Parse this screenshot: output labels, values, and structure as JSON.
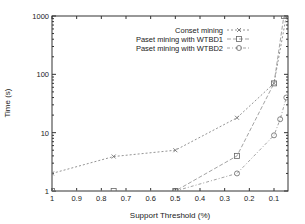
{
  "chart_data": {
    "type": "line",
    "title": "",
    "xlabel": "Support Threshold (%)",
    "ylabel": "Time (s)",
    "xscale": "linear-reversed",
    "yscale": "log",
    "xlim": [
      1,
      0.05
    ],
    "ylim": [
      1,
      1000
    ],
    "xticks": [
      "1",
      "0.9",
      "0.8",
      "0.7",
      "0.6",
      "0.5",
      "0.4",
      "0.3",
      "0.2",
      "0.1"
    ],
    "yticks": [
      "1",
      "10",
      "100",
      "1000"
    ],
    "legend_position": "upper right",
    "series": [
      {
        "name": "Conset mining",
        "marker": "x",
        "x": [
          1,
          0.75,
          0.5,
          0.25,
          0.1,
          0.05
        ],
        "y": [
          2,
          3.9,
          5,
          18,
          70,
          1000
        ]
      },
      {
        "name": "Paset mining with WTBD1",
        "marker": "square",
        "x": [
          1,
          0.75,
          0.5,
          0.25,
          0.1,
          0.06
        ],
        "y": [
          1,
          1,
          1,
          4,
          70,
          1000
        ]
      },
      {
        "name": "Paset mining with WTBD2",
        "marker": "circle",
        "x": [
          0.5,
          0.25,
          0.1,
          0.075,
          0.05
        ],
        "y": [
          1,
          2,
          9,
          17,
          40
        ]
      }
    ]
  },
  "legend": {
    "items": [
      {
        "label": "Conset mining"
      },
      {
        "label": "Paset mining with WTBD1"
      },
      {
        "label": "Paset mining with WTBD2"
      }
    ]
  }
}
